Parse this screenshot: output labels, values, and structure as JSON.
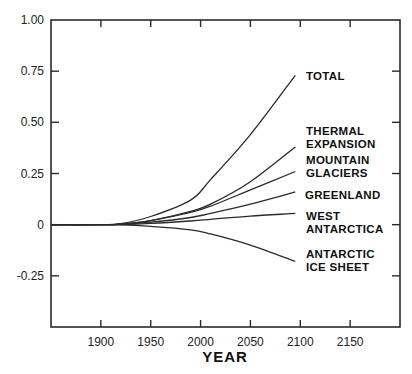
{
  "chart_data": {
    "type": "line",
    "title": "",
    "xlabel": "YEAR",
    "ylabel": "",
    "xlim": [
      1850,
      2200
    ],
    "ylim": [
      -0.5,
      1.0
    ],
    "x_ticks": [
      1900,
      1950,
      2000,
      2050,
      2100,
      2150
    ],
    "x_tick_labels": [
      "1900",
      "1950",
      "2000",
      "2050",
      "2100",
      "2150"
    ],
    "y_ticks": [
      1.0,
      0.75,
      0.5,
      0.25,
      0,
      -0.25
    ],
    "y_tick_labels": [
      "1.00",
      "0.75",
      "0.50",
      "0.25",
      "0",
      "-0.25"
    ],
    "grid": false,
    "legend": "inline labels at right end of each curve",
    "x": [
      1850,
      1900,
      1920,
      1950,
      1990,
      2010,
      2050,
      2095
    ],
    "series": [
      {
        "name": "TOTAL",
        "label_lines": [
          "TOTAL"
        ],
        "values": [
          0,
          0,
          0.005,
          0.04,
          0.12,
          0.22,
          0.44,
          0.73
        ]
      },
      {
        "name": "THERMAL EXPANSION",
        "label_lines": [
          "THERMAL",
          "EXPANSION"
        ],
        "values": [
          0,
          0,
          0.003,
          0.02,
          0.065,
          0.1,
          0.21,
          0.38
        ]
      },
      {
        "name": "MOUNTAIN GLACIERS",
        "label_lines": [
          "MOUNTAIN",
          "GLACIERS"
        ],
        "values": [
          0,
          0,
          0.003,
          0.02,
          0.06,
          0.09,
          0.17,
          0.26
        ]
      },
      {
        "name": "GREENLAND",
        "label_lines": [
          "GREENLAND"
        ],
        "values": [
          0,
          0,
          0.002,
          0.012,
          0.035,
          0.055,
          0.1,
          0.16
        ]
      },
      {
        "name": "WEST ANTARCTICA",
        "label_lines": [
          "WEST",
          "ANTARCTICA"
        ],
        "values": [
          0,
          0,
          0.001,
          0.006,
          0.018,
          0.026,
          0.042,
          0.055
        ]
      },
      {
        "name": "ANTARCTIC ICE SHEET",
        "label_lines": [
          "ANTARCTIC",
          "ICE SHEET"
        ],
        "values": [
          0,
          0,
          -0.001,
          -0.008,
          -0.025,
          -0.045,
          -0.1,
          -0.18
        ]
      }
    ]
  }
}
